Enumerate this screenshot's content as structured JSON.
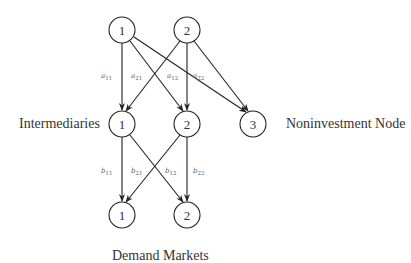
{
  "diagram": {
    "type": "network",
    "layers": [
      {
        "name": "top",
        "nodes": [
          {
            "id": "t1",
            "label": "1",
            "x": 122,
            "y": 30
          },
          {
            "id": "t2",
            "label": "2",
            "x": 187,
            "y": 30
          }
        ]
      },
      {
        "name": "intermediaries",
        "label": "Intermediaries",
        "nodes": [
          {
            "id": "m1",
            "label": "1",
            "x": 122,
            "y": 124
          },
          {
            "id": "m2",
            "label": "2",
            "x": 187,
            "y": 124
          },
          {
            "id": "m3",
            "label": "3",
            "x": 253,
            "y": 124
          }
        ]
      },
      {
        "name": "demand_markets",
        "label": "Demand Markets",
        "nodes": [
          {
            "id": "d1",
            "label": "1",
            "x": 122,
            "y": 215
          },
          {
            "id": "d2",
            "label": "2",
            "x": 187,
            "y": 215
          }
        ]
      }
    ],
    "side_labels": {
      "intermediaries": "Intermediaries",
      "noninvestment": "Noninvestment Node",
      "demand_markets": "Demand Markets"
    },
    "edge_labels_top": [
      {
        "base": "a",
        "sub": "11"
      },
      {
        "base": "a",
        "sub": "21"
      },
      {
        "base": "a",
        "sub": "12"
      },
      {
        "base": "a",
        "sub": "22"
      }
    ],
    "edge_labels_bottom": [
      {
        "base": "b",
        "sub": "11"
      },
      {
        "base": "b",
        "sub": "21"
      },
      {
        "base": "b",
        "sub": "12"
      },
      {
        "base": "b",
        "sub": "22"
      }
    ],
    "edges": [
      {
        "from": "t1",
        "to": "m1"
      },
      {
        "from": "t1",
        "to": "m2"
      },
      {
        "from": "t1",
        "to": "m3"
      },
      {
        "from": "t2",
        "to": "m1"
      },
      {
        "from": "t2",
        "to": "m2"
      },
      {
        "from": "t2",
        "to": "m3"
      },
      {
        "from": "m1",
        "to": "d1"
      },
      {
        "from": "m1",
        "to": "d2"
      },
      {
        "from": "m2",
        "to": "d1"
      },
      {
        "from": "m2",
        "to": "d2"
      }
    ]
  }
}
